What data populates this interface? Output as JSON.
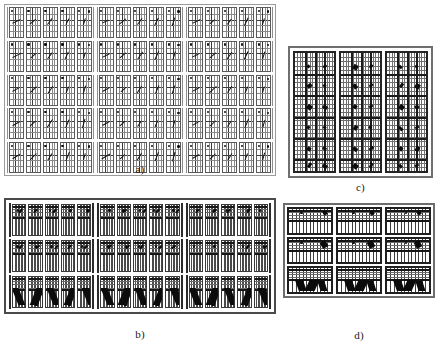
{
  "figure": {
    "background_color": "#ffffff",
    "ink_color": "#141414",
    "grid_color": "#8a8a8a",
    "panel_count": 4
  },
  "panels": {
    "a": {
      "label": "a)",
      "caption_label": "a)",
      "rows": 5,
      "column_groups": 3,
      "cells_per_group": 5,
      "total_cells": 75,
      "cell_grid": "5x5",
      "description": "grid of small square sub-plots each containing a short dark oriented stroke"
    },
    "b": {
      "label": "b)",
      "caption_label": "b)",
      "rows": 3,
      "column_groups": 3,
      "cells_per_group": 5,
      "total_cells": 45,
      "cell_grid": "vertical-bars",
      "description": "blocks of tall narrow vertical bars with dark horizontal caps and diagonal wedges in the bottom row"
    },
    "c": {
      "label": "c)",
      "caption_label": "c)",
      "rows": 1,
      "column_groups": 3,
      "cells_per_group": 1,
      "total_cells": 3,
      "cell_grid": "dense-fine",
      "description": "three tall dense fine-grid columns with bold vertical and horizontal separators and dark blobs"
    },
    "d": {
      "label": "d)",
      "caption_label": "d)",
      "rows": 3,
      "column_groups": 3,
      "cells_per_group": 1,
      "total_cells": 9,
      "cell_grid": "bars-over-grid",
      "description": "three by three blocks of vertical bars over a horizontal grid with dark triangular wedges in the bottom row"
    }
  },
  "chart_data": {
    "type": "heatmap",
    "title": "",
    "subtitle": "",
    "xlabel": "",
    "ylabel": "",
    "grid": true,
    "legend_position": "none",
    "annotations": [
      "a)",
      "b)",
      "c)",
      "d)"
    ],
    "panel_layout": [
      {
        "id": "a",
        "position": "top-left",
        "rows": 5,
        "cols": 15
      },
      {
        "id": "c",
        "position": "top-right",
        "rows": 1,
        "cols": 3
      },
      {
        "id": "b",
        "position": "bottom-left",
        "rows": 3,
        "cols": 15
      },
      {
        "id": "d",
        "position": "bottom-right",
        "rows": 3,
        "cols": 3
      }
    ],
    "series": [
      {
        "name": "panel-a-orientation-grid",
        "categories": [
          "g1",
          "g2",
          "g3"
        ],
        "values": [
          [
            10,
            35,
            60,
            80,
            95,
            10,
            35,
            60,
            80,
            95,
            10,
            35,
            60,
            80,
            95
          ],
          [
            12,
            38,
            62,
            82,
            96,
            12,
            38,
            62,
            82,
            96,
            12,
            38,
            62,
            82,
            96
          ],
          [
            15,
            40,
            65,
            85,
            97,
            15,
            40,
            65,
            85,
            97,
            15,
            40,
            65,
            85,
            97
          ],
          [
            18,
            42,
            66,
            86,
            98,
            18,
            42,
            66,
            86,
            98,
            18,
            42,
            66,
            86,
            98
          ],
          [
            20,
            45,
            68,
            88,
            99,
            20,
            45,
            68,
            88,
            99,
            20,
            45,
            68,
            88,
            99
          ]
        ]
      },
      {
        "name": "panel-b-bar-blocks",
        "categories": [
          "g1",
          "g2",
          "g3"
        ],
        "values": [
          [
            30,
            55,
            70,
            45,
            60,
            30,
            55,
            70,
            45,
            60,
            30,
            55,
            70,
            45,
            60
          ],
          [
            40,
            65,
            75,
            50,
            62,
            40,
            65,
            75,
            50,
            62,
            40,
            65,
            75,
            50,
            62
          ],
          [
            80,
            90,
            85,
            70,
            95,
            80,
            90,
            85,
            70,
            95,
            80,
            90,
            85,
            70,
            95
          ]
        ]
      },
      {
        "name": "panel-c-dense-columns",
        "categories": [
          "c1",
          "c2",
          "c3"
        ],
        "values": [
          88,
          82,
          79
        ]
      },
      {
        "name": "panel-d-bar-blocks",
        "categories": [
          "d1",
          "d2",
          "d3"
        ],
        "values": [
          [
            45,
            50,
            55
          ],
          [
            60,
            65,
            62
          ],
          [
            90,
            95,
            88
          ]
        ]
      }
    ]
  }
}
